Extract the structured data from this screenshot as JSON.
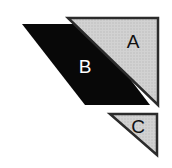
{
  "figure": {
    "width": 172,
    "height": 168,
    "background_color": "#ffffff"
  },
  "colors": {
    "gray_fill": "#c9c9c9",
    "gray_fill_light": "#d4d4d4",
    "outline_dark": "#2b2b2b",
    "black_fill": "#080808",
    "label_on_gray": "#111111",
    "label_on_black": "#ffffff",
    "background": "#ffffff"
  },
  "shapes": [
    {
      "id": "shape-a",
      "label": "A",
      "kind": "right-triangle",
      "fill": "gray",
      "points": "68,18 158,18 158,105",
      "label_x": 133,
      "label_y": 43,
      "label_size": 19,
      "label_color": "#111111",
      "stroke": "#2b2b2b",
      "stroke_width": 2.5
    },
    {
      "id": "shape-b",
      "label": "B",
      "kind": "parallelogram",
      "fill": "black",
      "points": "22,24 88,24 150,105 85,105",
      "label_x": 85,
      "label_y": 68,
      "label_size": 19,
      "label_color": "#ffffff",
      "stroke": "none",
      "stroke_width": 0
    },
    {
      "id": "shape-c",
      "label": "C",
      "kind": "right-triangle",
      "fill": "gray",
      "points": "110,114 157,114 157,155",
      "label_x": 138,
      "label_y": 128,
      "label_size": 19,
      "label_color": "#111111",
      "stroke": "#2b2b2b",
      "stroke_width": 2.5
    }
  ]
}
